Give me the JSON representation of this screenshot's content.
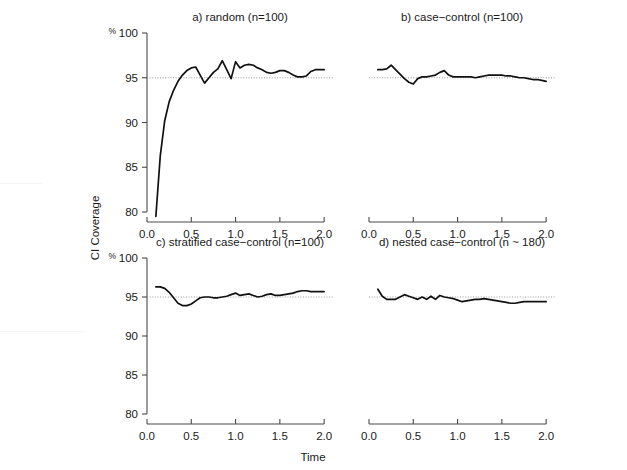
{
  "figure": {
    "axis_y_label": "CI Coverage",
    "axis_x_label": "Time",
    "percent_symbol": "%"
  },
  "chart_data": {
    "type": "line",
    "title": "",
    "xlabel": "Time",
    "ylabel": "CI Coverage",
    "ylim": [
      80,
      100
    ],
    "xlim": [
      0,
      2.1
    ],
    "yticks": [
      80,
      85,
      90,
      95,
      100
    ],
    "ytick_labels": [
      "80",
      "85",
      "90",
      "95",
      "100"
    ],
    "xticks": [
      0.0,
      0.5,
      1.0,
      1.5,
      2.0
    ],
    "xtick_labels": [
      "0.0",
      "0.5",
      "1.0",
      "1.5",
      "2.0"
    ],
    "grid": false,
    "legend": "none",
    "reference_line": {
      "y": 95,
      "style": "dotted",
      "color": "#8f8f8f"
    },
    "panels": [
      {
        "id": "a",
        "label": "a) random (n=100)",
        "show_y_axis": true,
        "show_x_axis": true,
        "x": [
          0.1,
          0.15,
          0.2,
          0.25,
          0.3,
          0.35,
          0.4,
          0.45,
          0.5,
          0.55,
          0.6,
          0.65,
          0.7,
          0.75,
          0.8,
          0.85,
          0.9,
          0.95,
          1.0,
          1.05,
          1.1,
          1.15,
          1.2,
          1.25,
          1.3,
          1.35,
          1.4,
          1.45,
          1.5,
          1.55,
          1.6,
          1.65,
          1.7,
          1.75,
          1.8,
          1.85,
          1.9,
          1.95,
          2.0
        ],
        "y": [
          79.5,
          86.3,
          90.2,
          92.3,
          93.6,
          94.6,
          95.3,
          95.8,
          96.1,
          96.2,
          95.3,
          94.4,
          95.0,
          95.6,
          96.0,
          96.9,
          95.9,
          94.9,
          96.8,
          96.1,
          96.4,
          96.5,
          96.4,
          96.1,
          95.9,
          95.6,
          95.5,
          95.6,
          95.8,
          95.8,
          95.6,
          95.3,
          95.1,
          95.1,
          95.2,
          95.7,
          95.9,
          95.9,
          95.9
        ]
      },
      {
        "id": "b",
        "label": "b) case−control (n=100)",
        "show_y_axis": false,
        "show_x_axis": true,
        "x": [
          0.1,
          0.15,
          0.2,
          0.25,
          0.3,
          0.35,
          0.4,
          0.45,
          0.5,
          0.55,
          0.6,
          0.65,
          0.7,
          0.75,
          0.8,
          0.85,
          0.9,
          0.95,
          1.0,
          1.05,
          1.1,
          1.15,
          1.2,
          1.25,
          1.3,
          1.35,
          1.4,
          1.45,
          1.5,
          1.55,
          1.6,
          1.65,
          1.7,
          1.75,
          1.8,
          1.85,
          1.9,
          1.95,
          2.0
        ],
        "y": [
          95.9,
          95.9,
          96.0,
          96.4,
          95.9,
          95.4,
          94.9,
          94.5,
          94.3,
          94.9,
          95.1,
          95.1,
          95.2,
          95.3,
          95.6,
          95.8,
          95.3,
          95.1,
          95.1,
          95.1,
          95.1,
          95.1,
          95.0,
          95.1,
          95.2,
          95.3,
          95.3,
          95.3,
          95.3,
          95.2,
          95.2,
          95.1,
          95.0,
          95.0,
          94.9,
          94.8,
          94.8,
          94.7,
          94.6
        ]
      },
      {
        "id": "c",
        "label": "c) stratified case−control (n=100)",
        "show_y_axis": true,
        "show_x_axis": true,
        "x": [
          0.1,
          0.15,
          0.2,
          0.25,
          0.3,
          0.35,
          0.4,
          0.45,
          0.5,
          0.55,
          0.6,
          0.65,
          0.7,
          0.75,
          0.8,
          0.85,
          0.9,
          0.95,
          1.0,
          1.05,
          1.1,
          1.15,
          1.2,
          1.25,
          1.3,
          1.35,
          1.4,
          1.45,
          1.5,
          1.55,
          1.6,
          1.65,
          1.7,
          1.75,
          1.8,
          1.85,
          1.9,
          1.95,
          2.0
        ],
        "y": [
          96.3,
          96.3,
          96.1,
          95.6,
          94.9,
          94.2,
          93.9,
          93.9,
          94.1,
          94.5,
          94.9,
          95.0,
          95.0,
          94.9,
          94.9,
          95.0,
          95.1,
          95.3,
          95.5,
          95.2,
          95.3,
          95.4,
          95.2,
          95.0,
          95.1,
          95.3,
          95.4,
          95.2,
          95.2,
          95.3,
          95.4,
          95.5,
          95.7,
          95.8,
          95.8,
          95.7,
          95.7,
          95.7,
          95.7
        ]
      },
      {
        "id": "d",
        "label": "d) nested case−control (n ~ 180)",
        "show_y_axis": false,
        "show_x_axis": true,
        "x": [
          0.1,
          0.15,
          0.2,
          0.25,
          0.3,
          0.35,
          0.4,
          0.45,
          0.5,
          0.55,
          0.6,
          0.65,
          0.7,
          0.75,
          0.8,
          0.85,
          0.9,
          0.95,
          1.0,
          1.05,
          1.1,
          1.15,
          1.2,
          1.25,
          1.3,
          1.35,
          1.4,
          1.45,
          1.5,
          1.55,
          1.6,
          1.65,
          1.7,
          1.75,
          1.8,
          1.85,
          1.9,
          1.95,
          2.0
        ],
        "y": [
          96.0,
          95.1,
          94.7,
          94.7,
          94.7,
          95.0,
          95.3,
          95.1,
          94.9,
          94.7,
          95.0,
          94.7,
          95.1,
          94.7,
          95.2,
          95.0,
          94.9,
          94.8,
          94.6,
          94.4,
          94.5,
          94.6,
          94.7,
          94.7,
          94.8,
          94.7,
          94.6,
          94.5,
          94.4,
          94.3,
          94.2,
          94.2,
          94.3,
          94.4,
          94.4,
          94.4,
          94.4,
          94.4,
          94.4
        ]
      }
    ]
  }
}
